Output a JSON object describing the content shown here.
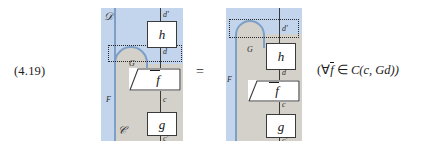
{
  "equation": {
    "number": "(4.19)",
    "relation": "=",
    "side_condition_open": "(",
    "side_condition_forall": "∀",
    "side_condition_fbar": "f",
    "side_condition_in": "∈",
    "side_condition_cat": "C",
    "side_condition_args": "(c, Gd))"
  },
  "left_diagram": {
    "outer_region_label": "𝒟",
    "inner_region_label": "𝒞",
    "functor_boundary_label": "F",
    "cap_label": "G",
    "boxes": [
      {
        "name": "h-box",
        "label": "h"
      },
      {
        "name": "fbar-box",
        "label": "f"
      },
      {
        "name": "g-box",
        "label": "g"
      }
    ],
    "wire_labels": {
      "top": "d'",
      "middle": "d",
      "lower": "c",
      "bottom": "c'"
    }
  },
  "right_diagram": {
    "functor_boundary_label": "F",
    "cap_label": "G",
    "boxes": [
      {
        "name": "h-box",
        "label": "h"
      },
      {
        "name": "fbar-box",
        "label": "f"
      },
      {
        "name": "g-box",
        "label": "g"
      }
    ],
    "wire_labels": {
      "top": "d'",
      "middle": "d",
      "lower": "c",
      "bottom": "c'"
    }
  },
  "colors": {
    "outer_region": "#c3d5ec",
    "inner_region": "#d4d1cb",
    "boundary_line": "#7e9fc6",
    "wire": "#3a3a3a",
    "dotted_box": "#262626",
    "page_background": "#ffffff"
  }
}
